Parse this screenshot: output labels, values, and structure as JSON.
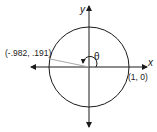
{
  "diagram": {
    "type": "unit-circle",
    "axes": {
      "x_label": "x",
      "y_label": "y"
    },
    "angle_label": "θ",
    "points": [
      {
        "label": "(-.982, .191)",
        "x": -0.982,
        "y": 0.191
      },
      {
        "label": "(1, 0)",
        "x": 1,
        "y": 0
      }
    ],
    "colors": {
      "stroke": "#1a1a1a",
      "radius_line": "#a8a8a8",
      "background": "#ffffff"
    }
  }
}
